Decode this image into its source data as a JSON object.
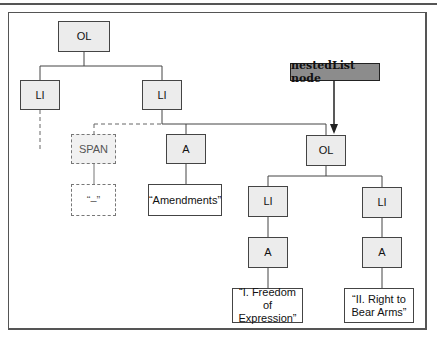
{
  "diagram": {
    "pointer_label": "nestedList node",
    "nodes": {
      "root_ol": "OL",
      "li_left": "LI",
      "li_mid": "LI",
      "span": "SPAN",
      "span_text": "“–”",
      "a_mid": "A",
      "amendments_text": "“Amendments”",
      "nested_ol": "OL",
      "nested_li_1": "LI",
      "nested_li_2": "LI",
      "nested_a_1": "A",
      "nested_a_2": "A",
      "text_1": "“I. Freedom of Expression”",
      "text_2": "“II. Right to Bear Arms”"
    },
    "colors": {
      "element_fill": "#ececec",
      "pointer_fill": "#8c8c8c",
      "line": "#444444"
    }
  }
}
